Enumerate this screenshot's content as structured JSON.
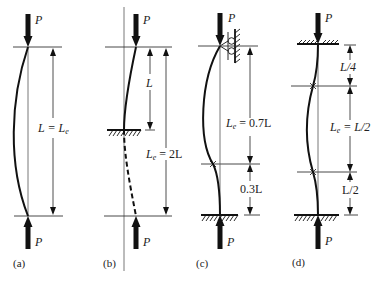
{
  "figure": {
    "load_label": "P",
    "panels": [
      {
        "id": "a",
        "caption": "(a)",
        "end_conditions": "pinned-pinned",
        "dimension_labels": [
          {
            "text": "L = L",
            "sub": "e"
          }
        ]
      },
      {
        "id": "b",
        "caption": "(b)",
        "end_conditions": "fixed-free",
        "dimension_labels": [
          {
            "text": "L",
            "sub": ""
          },
          {
            "text": "L",
            "sub": "e",
            "suffix": " = 2L"
          }
        ]
      },
      {
        "id": "c",
        "caption": "(c)",
        "end_conditions": "fixed-pinned",
        "dimension_labels": [
          {
            "text": "L",
            "sub": "e",
            "suffix": " = 0.7L"
          },
          {
            "text": "0.3L",
            "sub": ""
          }
        ]
      },
      {
        "id": "d",
        "caption": "(d)",
        "end_conditions": "fixed-fixed",
        "dimension_labels": [
          {
            "text": "L/4",
            "sub": ""
          },
          {
            "text": "L",
            "sub": "e",
            "suffix": " = L/2"
          },
          {
            "text": "L/2",
            "sub": ""
          }
        ]
      }
    ]
  }
}
